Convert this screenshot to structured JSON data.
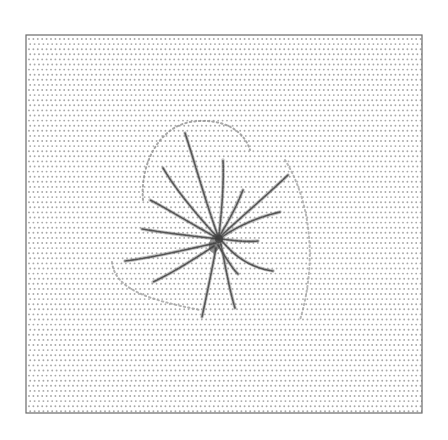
{
  "figure": {
    "background": "#ffffff",
    "frame": {
      "x": 26,
      "y": 35,
      "width": 396,
      "height": 378,
      "stroke": "#6a6a6a"
    },
    "dot_grid": {
      "dx": 4.4,
      "dy": 5.1,
      "radius": 0.95,
      "color": "#a9a9a9",
      "row_jitter": 1.2
    },
    "starburst": {
      "center": [
        219,
        239
      ],
      "color": "#4a4a4a",
      "hub_color": "#3a3a3a",
      "arms": [
        [
          [
            219,
            239
          ],
          [
            205,
            200
          ],
          [
            194,
            160
          ],
          [
            185,
            133
          ]
        ],
        [
          [
            219,
            239
          ],
          [
            196,
            214
          ],
          [
            176,
            190
          ],
          [
            163,
            168
          ]
        ],
        [
          [
            219,
            239
          ],
          [
            188,
            222
          ],
          [
            166,
            208
          ],
          [
            150,
            200
          ]
        ],
        [
          [
            219,
            239
          ],
          [
            182,
            235
          ],
          [
            160,
            232
          ],
          [
            142,
            229
          ]
        ],
        [
          [
            216,
            243
          ],
          [
            180,
            251
          ],
          [
            150,
            258
          ],
          [
            125,
            261
          ]
        ],
        [
          [
            214,
            246
          ],
          [
            190,
            262
          ],
          [
            170,
            274
          ],
          [
            153,
            282
          ]
        ],
        [
          [
            216,
            248
          ],
          [
            211,
            275
          ],
          [
            206,
            298
          ],
          [
            202,
            317
          ]
        ],
        [
          [
            221,
            244
          ],
          [
            226,
            270
          ],
          [
            230,
            292
          ],
          [
            235,
            308
          ]
        ],
        [
          [
            222,
            241
          ],
          [
            236,
            258
          ],
          [
            252,
            268
          ],
          [
            273,
            271
          ]
        ],
        [
          [
            222,
            239
          ],
          [
            236,
            241
          ],
          [
            248,
            242
          ],
          [
            258,
            241
          ]
        ],
        [
          [
            222,
            237
          ],
          [
            238,
            226
          ],
          [
            258,
            217
          ],
          [
            280,
            212
          ]
        ],
        [
          [
            221,
            236
          ],
          [
            240,
            218
          ],
          [
            266,
            196
          ],
          [
            288,
            175
          ]
        ],
        [
          [
            220,
            235
          ],
          [
            232,
            216
          ],
          [
            239,
            200
          ],
          [
            243,
            190
          ]
        ],
        [
          [
            219,
            235
          ],
          [
            222,
            208
          ],
          [
            224,
            182
          ],
          [
            223,
            160
          ]
        ],
        [
          [
            218,
            245
          ],
          [
            226,
            258
          ],
          [
            232,
            268
          ],
          [
            238,
            274
          ]
        ]
      ]
    },
    "faint_arcs": [
      {
        "path": "M143,200 C140,165 158,128 190,122 C222,117 244,130 250,150",
        "color": "#8a8a8a"
      },
      {
        "path": "M112,262 C115,290 150,300 200,310",
        "color": "#9a9a9a"
      },
      {
        "path": "M285,160 C310,200 318,260 300,320",
        "color": "#a0a0a0"
      }
    ]
  }
}
